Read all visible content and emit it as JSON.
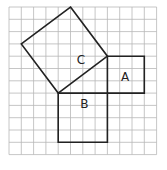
{
  "diagram": {
    "grid": {
      "columns": 12,
      "rows": 12
    },
    "squares": [
      {
        "label": "A",
        "side_units": 3,
        "corners": [
          [
            8,
            4
          ],
          [
            11,
            4
          ],
          [
            11,
            7
          ],
          [
            8,
            7
          ]
        ],
        "label_pos": [
          9.1,
          6.0
        ]
      },
      {
        "label": "B",
        "side_units": 4,
        "corners": [
          [
            4,
            7
          ],
          [
            8,
            7
          ],
          [
            8,
            11
          ],
          [
            4,
            11
          ]
        ],
        "label_pos": [
          5.8,
          8.2
        ]
      },
      {
        "label": "C",
        "side_units": 5,
        "corners": [
          [
            5,
            0
          ],
          [
            8,
            4
          ],
          [
            4,
            7
          ],
          [
            1,
            3
          ]
        ],
        "label_pos": [
          5.5,
          4.6
        ]
      }
    ],
    "colors": {
      "grid": "#b8b8b8",
      "lines": "#222222",
      "background": "#ffffff"
    }
  }
}
